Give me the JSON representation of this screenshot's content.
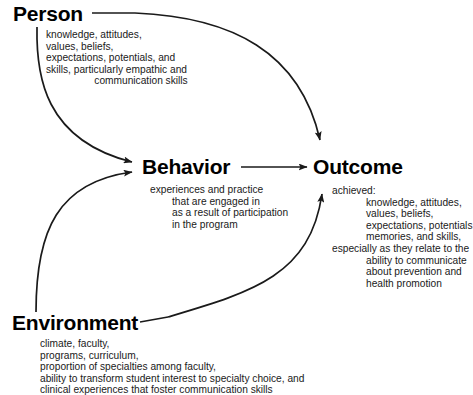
{
  "diagram": {
    "stroke_color": "#1a1a1a",
    "text_color": "#1a1a1a",
    "background_color": "#ffffff",
    "nodes": {
      "person": {
        "label": "Person",
        "description_lines": [
          "knowledge, attitudes,",
          "values, beliefs,",
          "expectations, potentials, and",
          "skills,  particularly empathic and",
          "communication skills"
        ]
      },
      "behavior": {
        "label": "Behavior",
        "description_lines": [
          "experiences and practice",
          "that are engaged in",
          "as a result of participation",
          "in the program"
        ]
      },
      "outcome": {
        "label": "Outcome",
        "description_lines": [
          "achieved:",
          "knowledge, attitudes,",
          "values, beliefs,",
          "expectations, potentials,",
          "memories, and skills,",
          "especially as they relate to the",
          "ability to communicate",
          "about prevention and",
          "health promotion"
        ]
      },
      "environment": {
        "label": "Environment",
        "description_lines": [
          "climate, faculty,",
          "programs, curriculum,",
          "proportion of specialties among faculty,",
          "ability to transform student interest to specialty choice, and",
          "clinical experiences that foster communication skills"
        ]
      }
    },
    "edges": [
      {
        "name": "person-to-behavior",
        "from": "Person",
        "to": "Behavior"
      },
      {
        "name": "person-to-outcome",
        "from": "Person",
        "to": "Outcome"
      },
      {
        "name": "environment-to-behavior",
        "from": "Environment",
        "to": "Behavior"
      },
      {
        "name": "environment-to-outcome",
        "from": "Environment",
        "to": "Outcome"
      },
      {
        "name": "behavior-to-outcome",
        "from": "Behavior",
        "to": "Outcome"
      }
    ]
  }
}
